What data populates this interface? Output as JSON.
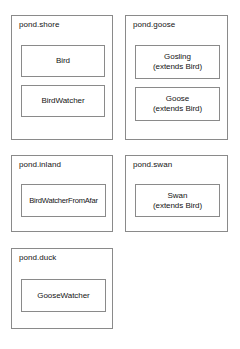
{
  "diagram": {
    "type": "uml-package-diagram",
    "background_color": "#ffffff",
    "border_color": "#8a8a8a",
    "text_color": "#141414",
    "packages": [
      {
        "id": "pond-shore",
        "label": "pond.shore",
        "classes": [
          {
            "id": "bird",
            "name": "Bird",
            "stereotype": ""
          },
          {
            "id": "birdwatcher",
            "name": "BirdWatcher",
            "stereotype": ""
          }
        ]
      },
      {
        "id": "pond-goose",
        "label": "pond.goose",
        "classes": [
          {
            "id": "gosling",
            "name": "Gosling",
            "stereotype": "(extends Bird)"
          },
          {
            "id": "goose",
            "name": "Goose",
            "stereotype": "(extends Bird)"
          }
        ]
      },
      {
        "id": "pond-inland",
        "label": "pond.inland",
        "classes": [
          {
            "id": "birdwatcherfromafar",
            "name": "BirdWatcherFromAfar",
            "stereotype": ""
          }
        ]
      },
      {
        "id": "pond-swan",
        "label": "pond.swan",
        "classes": [
          {
            "id": "swan",
            "name": "Swan",
            "stereotype": "(extends Bird)"
          }
        ]
      },
      {
        "id": "pond-duck",
        "label": "pond.duck",
        "classes": [
          {
            "id": "goosewatcher",
            "name": "GooseWatcher",
            "stereotype": ""
          }
        ]
      }
    ]
  }
}
